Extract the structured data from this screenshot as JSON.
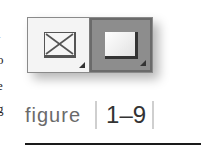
{
  "edge_text": [
    "l",
    "o",
    "e",
    "g"
  ],
  "swatches": [
    {
      "name": "no-fill",
      "icon": "no-fill-x-icon",
      "selected": false
    },
    {
      "name": "fill",
      "icon": "filled-square-icon",
      "selected": true
    }
  ],
  "caption": {
    "label": "figure",
    "number": "1–9"
  },
  "colors": {
    "selected_bg": "#8d8d8d",
    "unselected_bg": "#f4f4f4",
    "rule": "#1a1a1a"
  }
}
